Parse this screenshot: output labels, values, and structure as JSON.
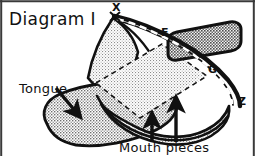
{
  "figure": {
    "title": "Diagram I",
    "labels": {
      "tongue": "Tongue",
      "mouth_pieces": "Mouth pieces",
      "point_x": "X",
      "point_f": "F",
      "point_g": "G",
      "point_z": "Z"
    },
    "colors": {
      "ink": "#111111",
      "paper": "#ffffff",
      "shade_light": "#d8d8d8",
      "shade_mid": "#c4c4c4",
      "shade_dark": "#9a9a9a",
      "frame": "#3a3a3a"
    },
    "elements": {
      "tongue_shape": "tongue-body",
      "mouth_band": "lower-mouth-band",
      "upper_flap": "upper-mouthpiece-flap",
      "dashed_ridge": "dashed-ridge-line",
      "arrow_tongue": "tongue-pointer-arrow",
      "arrow_mouth_left": "mouth-pointer-arrow-left",
      "arrow_mouth_right": "mouth-pointer-arrow-right"
    }
  }
}
